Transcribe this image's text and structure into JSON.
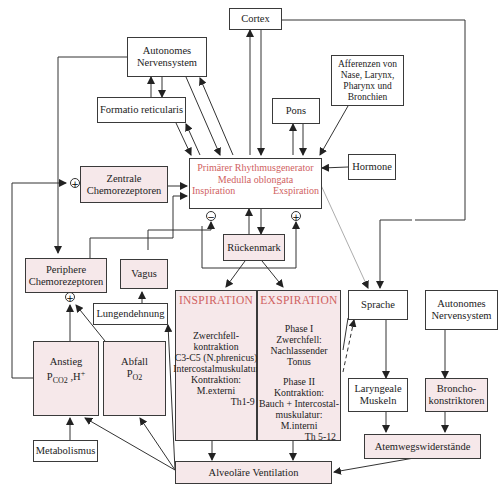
{
  "diagram": {
    "nodes": {
      "cortex": "Cortex",
      "autonomes_ns_top": [
        "Autonomes",
        "Nervensystem"
      ],
      "formatio": "Formatio reticularis",
      "afferenzen": [
        "Afferenzen von",
        "Nase, Larynx,",
        "Pharynx und",
        "Bronchien"
      ],
      "pons": "Pons",
      "hormone": "Hormone",
      "rhythmus": {
        "line1": "Primärer Rhythmusgenerator",
        "line2": "Medulla oblongata",
        "left": "Inspiration",
        "right": "Exspiration"
      },
      "zentrale": [
        "Zentrale",
        "Chemorezeptoren"
      ],
      "periphere": [
        "Periphere",
        "Chemorezeptoren"
      ],
      "vagus": "Vagus",
      "rueckenmark": "Rückenmark",
      "lungendehnung": "Lungendehnung",
      "anstieg": {
        "line1": "Anstieg",
        "p": "P",
        "sub": "CO2",
        "rest": " ,H",
        "sup": "+"
      },
      "abfall": {
        "line1": "Abfall",
        "p": "P",
        "sub": "O2"
      },
      "metabolismus": "Metabolismus",
      "inspiration": {
        "title": "INSPIRATION",
        "lines": [
          "Zwerchfell-",
          "kontraktion",
          "C3-C5 (N.phrenicus)",
          "Intercostalmuskulatur",
          "Kontraktion: M.externi",
          "Th1-9"
        ]
      },
      "exspiration": {
        "title": "EXSPIRATION",
        "lines": [
          "Phase I",
          "Zwerchfell:",
          "Nachlassender Tonus",
          "",
          "Phase II",
          "Kontraktion:",
          "Bauch + Intercostal-",
          "muskulatur: M.interni",
          "Th 5-12"
        ]
      },
      "sprache": "Sprache",
      "autonomes_ns_right": [
        "Autonomes",
        "Nervensystem"
      ],
      "laryngeale": [
        "Laryngeale",
        "Muskeln"
      ],
      "broncho": [
        "Broncho-",
        "konstriktoren"
      ],
      "atemwegs": "Atemwegswiderstände",
      "alveolaere": "Alveoläre Ventilation"
    },
    "symbols": {
      "plus": "+",
      "minus": "−"
    },
    "colors": {
      "highlight_text": "#d0625f",
      "highlight_fill": "#f6e8ea",
      "line": "#333333"
    }
  }
}
